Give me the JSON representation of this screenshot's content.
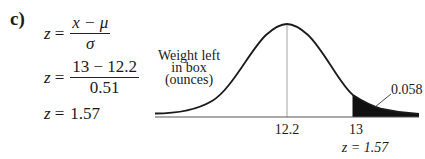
{
  "part_label": "c)",
  "equations": {
    "line1": {
      "lhs": "z",
      "eq": "=",
      "numerator": "x − μ",
      "denominator": "σ"
    },
    "line2": {
      "lhs": "z",
      "eq": "=",
      "numerator": "13 − 12.2",
      "denominator": "0.51"
    },
    "line3": {
      "lhs": "z",
      "eq": "=",
      "value": "1.57"
    }
  },
  "diagram": {
    "curve_label": [
      "Weight left",
      "in box",
      "(ounces)"
    ],
    "mean_label": "12.2",
    "cutoff_label": "13",
    "z_label": "z = 1.57",
    "tail_area_label": "0.058",
    "shade_color": "#111111",
    "line_color": "#1a1a1a",
    "mean_line_color": "#9a9a9a"
  }
}
